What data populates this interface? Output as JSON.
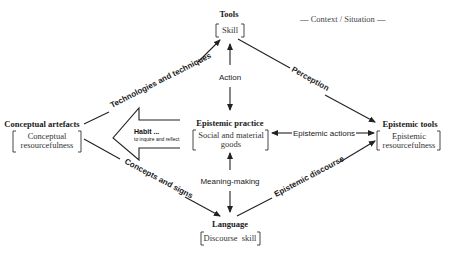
{
  "context_label": "— Context / Situation —",
  "nodes": {
    "tools": {
      "title": "Tools",
      "body": [
        "Skill"
      ]
    },
    "conceptual_artefacts": {
      "title": "Conceptual artefacts",
      "body": [
        "Conceptual",
        "resourcefulness"
      ]
    },
    "epistemic_practice": {
      "title": "Epistemic practice",
      "body": [
        "Social and material",
        "goods"
      ]
    },
    "epistemic_tools": {
      "title": "Epistemic tools",
      "body": [
        "Epistemic",
        "resourcefulness"
      ]
    },
    "language": {
      "title": "Language",
      "body": [
        "Discourse  skill"
      ]
    }
  },
  "edges": {
    "technologies": "Technologies and techniques",
    "perception": "Perception",
    "action": "Action",
    "epistemic_actions": "Epistemic actions",
    "concepts": "Concepts and signs",
    "meaning_making": "Meaning-making",
    "epistemic_discourse": "Epistemic discourse"
  },
  "habit_arrow": {
    "title": "Habit ...",
    "subtitle": "to inquire and reflect"
  },
  "colors": {
    "ink": "#222222",
    "background": "#ffffff"
  }
}
